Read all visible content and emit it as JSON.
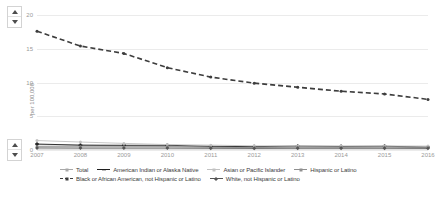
{
  "controls": {
    "top_scroll": {
      "up_label": "▲",
      "down_label": "▼"
    },
    "bottom_scroll": {
      "up_label": "▲",
      "down_label": "▼"
    }
  },
  "chart_data": {
    "type": "line",
    "title": "",
    "xlabel": "",
    "ylabel": "per 100,000",
    "categories": [
      "2007",
      "2008",
      "2009",
      "2010",
      "2011",
      "2012",
      "2013",
      "2014",
      "2015",
      "2016"
    ],
    "x": [
      2007,
      2008,
      2009,
      2010,
      2011,
      2012,
      2013,
      2014,
      2015,
      2016
    ],
    "ylim": [
      0,
      20
    ],
    "yticks": [
      0,
      5,
      10,
      15,
      20
    ],
    "ytick_labels": [
      "0",
      "5",
      "10",
      "15",
      "20"
    ],
    "grid": true,
    "legend_position": "bottom",
    "series": [
      {
        "name": "Total",
        "color": "#a8a8a8",
        "marker": "circle",
        "dash": "none",
        "values": [
          0.78,
          0.7,
          0.62,
          0.55,
          0.5,
          0.45,
          0.44,
          0.43,
          0.43,
          0.42
        ]
      },
      {
        "name": "American Indian or Alaska Native",
        "color": "#1f1f1f",
        "marker": "plus",
        "dash": "none",
        "values": [
          0.88,
          0.72,
          0.7,
          0.7,
          0.55,
          0.5,
          0.58,
          0.52,
          0.56,
          0.42
        ]
      },
      {
        "name": "Asian or Pacific Islander",
        "color": "#c2c2c2",
        "marker": "circle",
        "dash": "none",
        "values": [
          1.4,
          1.18,
          0.98,
          0.8,
          0.72,
          0.62,
          0.6,
          0.6,
          0.6,
          0.58
        ]
      },
      {
        "name": "Hispanic or Latino",
        "color": "#8f8f8f",
        "marker": "circle",
        "dash": "none",
        "values": [
          0.5,
          0.48,
          0.48,
          0.48,
          0.4,
          0.36,
          0.44,
          0.42,
          0.46,
          0.36
        ]
      },
      {
        "name": "Black or African American, not Hispanic or Latino",
        "color": "#3d3d3d",
        "marker": "circle",
        "dash": "dashed",
        "values": [
          17.6,
          15.4,
          14.3,
          12.2,
          10.8,
          9.9,
          9.3,
          8.7,
          8.3,
          7.5
        ]
      },
      {
        "name": "White, not Hispanic or Latino",
        "color": "#555555",
        "marker": "diamond",
        "dash": "none",
        "values": [
          0.3,
          0.28,
          0.28,
          0.28,
          0.26,
          0.24,
          0.26,
          0.26,
          0.26,
          0.24
        ]
      }
    ]
  }
}
